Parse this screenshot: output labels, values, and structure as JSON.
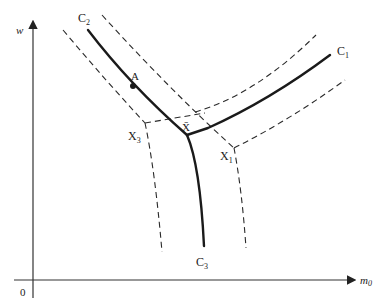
{
  "diagram": {
    "type": "phase-diagram",
    "axes": {
      "y_label": "w",
      "x_label": "m",
      "x_label_sub": "0",
      "origin": "0"
    },
    "curves": [
      {
        "name": "C",
        "sub": "2",
        "style": "solid"
      },
      {
        "name": "C",
        "sub": "1",
        "style": "solid"
      },
      {
        "name": "C",
        "sub": "3",
        "style": "solid"
      }
    ],
    "boundaries": [
      {
        "name": "X",
        "sub": "3",
        "style": "dashed"
      },
      {
        "name": "X",
        "sub": "1",
        "style": "dashed"
      }
    ],
    "points": [
      {
        "label": "A"
      },
      {
        "label": "X̄"
      }
    ],
    "colors": {
      "ink": "#1a1a1a",
      "background": "#ffffff"
    }
  }
}
